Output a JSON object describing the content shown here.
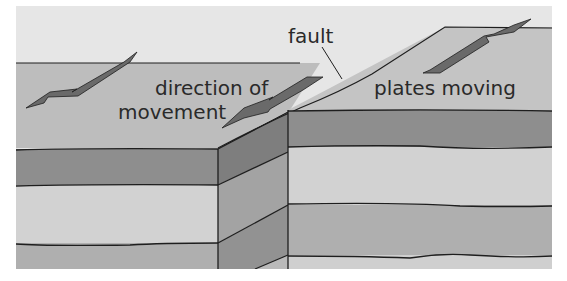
{
  "diagram": {
    "type": "geology-cross-section",
    "labels": {
      "fault": "fault",
      "direction_line1": "direction of",
      "direction_line2": "movement",
      "plates_moving": "plates moving"
    },
    "arrows": [
      {
        "name": "left-plate-arrow",
        "direction": "down-left"
      },
      {
        "name": "center-arrow",
        "direction": "down-left"
      },
      {
        "name": "right-plate-arrow",
        "direction": "up-right"
      }
    ],
    "colors": {
      "sky": "#e6e6e6",
      "surface": "#bdbdbd",
      "raised_surface": "#c4c4c4",
      "dark_layer": "#8e8e8e",
      "light_layer": "#d2d2d2",
      "mid_layer": "#afafaf",
      "side_dark": "#7e7e7e",
      "side_mid": "#a3a3a3",
      "arrow_fill": "#6a6a6a",
      "outline": "#1e1e1e"
    }
  }
}
